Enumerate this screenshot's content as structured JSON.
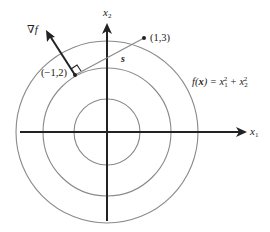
{
  "figure": {
    "function_label": {
      "prefix": "f(",
      "var": "x",
      "mid": ") = x",
      "sub1": "1",
      "sup1": "2",
      "plus": " + x",
      "sub2": "2",
      "sup2": "2"
    },
    "axes": {
      "x1": {
        "base": "x",
        "sub": "1"
      },
      "x2": {
        "base": "x",
        "sub": "2"
      }
    },
    "points": [
      {
        "label": "(1,3)"
      },
      {
        "label": "(−1,2)"
      }
    ],
    "gradient_label": "∇f",
    "direction_label": "s",
    "contours": {
      "count": 3,
      "color": "#8a8a8a"
    },
    "colors": {
      "axis": "#222222",
      "contour": "#8a8a8a",
      "segment": "#8a8a8a",
      "text": "#222222"
    }
  }
}
